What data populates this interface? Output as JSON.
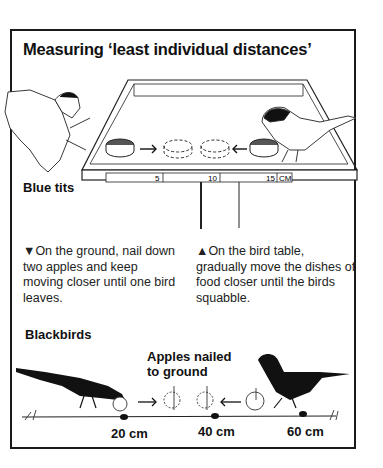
{
  "title": "Measuring ‘least individual distances’",
  "bird_table": {
    "ruler": {
      "ticks": [
        "5",
        "10",
        "15"
      ],
      "unit": "CM"
    },
    "species_label": "Blue tits"
  },
  "instructions": {
    "ground": {
      "marker": "▼",
      "text_lines": [
        "On the ground, nail down",
        "two apples and keep",
        "moving closer until one bird",
        "leaves."
      ]
    },
    "table": {
      "marker": "▲",
      "text_lines": [
        "On the bird table,",
        "gradually move the dishes of",
        "food closer until the birds",
        "squabble."
      ]
    }
  },
  "ground_scene": {
    "species_label": "Blackbirds",
    "apples_label_lines": [
      "Apples nailed",
      "to ground"
    ],
    "distances": [
      "20 cm",
      "40 cm",
      "60 cm"
    ]
  }
}
